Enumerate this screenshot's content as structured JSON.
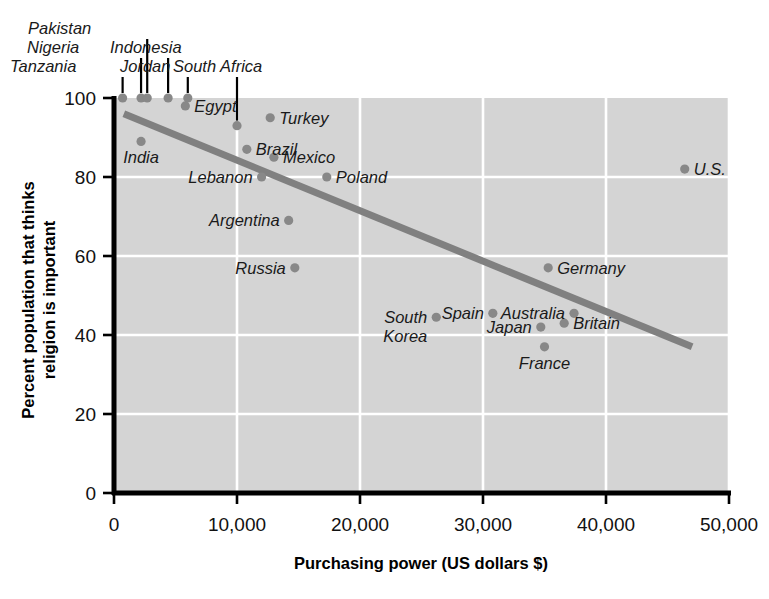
{
  "chart_data": {
    "type": "scatter",
    "title": "",
    "xlabel": "Purchasing power (US dollars $)",
    "ylabel": "Percent population that thinks religion is important",
    "xlim": [
      0,
      50000
    ],
    "ylim": [
      0,
      100
    ],
    "xticks": [
      "0",
      "10,000",
      "20,000",
      "30,000",
      "40,000",
      "50,000"
    ],
    "xtick_values": [
      0,
      10000,
      20000,
      30000,
      40000,
      50000
    ],
    "yticks": [
      "0",
      "20",
      "40",
      "60",
      "80",
      "100"
    ],
    "ytick_values": [
      0,
      20,
      40,
      60,
      80,
      100
    ],
    "grid": true,
    "grid_color": "#ffffff",
    "plot_background": "#d4d4d4",
    "point_color": "#888888",
    "trendline_color": "#808080",
    "legend": "none",
    "points": [
      {
        "label": "Tanzania",
        "x": 700,
        "y": 100,
        "label_pos": "leader",
        "label_x": 10,
        "label_y": 72,
        "anchor": "start"
      },
      {
        "label": "Nigeria",
        "x": 2200,
        "y": 100,
        "label_pos": "leader",
        "label_x": 27,
        "label_y": 53,
        "anchor": "start"
      },
      {
        "label": "Pakistan",
        "x": 2700,
        "y": 100,
        "label_pos": "leader",
        "label_x": 28,
        "label_y": 34,
        "anchor": "start"
      },
      {
        "label": "Indonesia",
        "x": 4400,
        "y": 100,
        "label_pos": "leader",
        "label_x": 110,
        "label_y": 53,
        "anchor": "start"
      },
      {
        "label": "Jordan",
        "x": 6000,
        "y": 100,
        "label_pos": "leader",
        "label_x": 120,
        "label_y": 72,
        "anchor": "start"
      },
      {
        "label": "South Africa",
        "x": 10000,
        "y": 93,
        "label_pos": "leader",
        "label_x": 173,
        "label_y": 72,
        "anchor": "start"
      },
      {
        "label": "Egypt",
        "x": 5800,
        "y": 98,
        "label_pos": "right",
        "anchor": "start"
      },
      {
        "label": "India",
        "x": 2200,
        "y": 89,
        "label_pos": "below",
        "anchor": "middle"
      },
      {
        "label": "Turkey",
        "x": 12700,
        "y": 95,
        "label_pos": "right",
        "anchor": "start"
      },
      {
        "label": "Brazil",
        "x": 10800,
        "y": 87,
        "label_pos": "right",
        "anchor": "start"
      },
      {
        "label": "Mexico",
        "x": 13000,
        "y": 85,
        "label_pos": "right",
        "anchor": "start"
      },
      {
        "label": "Lebanon",
        "x": 12000,
        "y": 80,
        "label_pos": "left",
        "anchor": "end"
      },
      {
        "label": "Poland",
        "x": 17300,
        "y": 80,
        "label_pos": "right",
        "anchor": "start"
      },
      {
        "label": "Argentina",
        "x": 14200,
        "y": 69,
        "label_pos": "left",
        "anchor": "end"
      },
      {
        "label": "Russia",
        "x": 14700,
        "y": 57,
        "label_pos": "left",
        "anchor": "end"
      },
      {
        "label": "Germany",
        "x": 35300,
        "y": 57,
        "label_pos": "right",
        "anchor": "start"
      },
      {
        "label": "South Korea",
        "x": 26200,
        "y": 44.5,
        "label_pos": "left2",
        "anchor": "end"
      },
      {
        "label": "Spain",
        "x": 30800,
        "y": 45.5,
        "label_pos": "left",
        "anchor": "end"
      },
      {
        "label": "Australia",
        "x": 37400,
        "y": 45.5,
        "label_pos": "left",
        "anchor": "end"
      },
      {
        "label": "Japan",
        "x": 34700,
        "y": 42,
        "label_pos": "left",
        "anchor": "end"
      },
      {
        "label": "Britain",
        "x": 36600,
        "y": 43,
        "label_pos": "right",
        "anchor": "start"
      },
      {
        "label": "France",
        "x": 35000,
        "y": 37,
        "label_pos": "below",
        "anchor": "middle"
      },
      {
        "label": "U.S.",
        "x": 46400,
        "y": 82,
        "label_pos": "right",
        "anchor": "start"
      }
    ],
    "trendline": {
      "x_start": 800,
      "y_start": 96,
      "x_end": 47000,
      "y_end": 37
    }
  }
}
